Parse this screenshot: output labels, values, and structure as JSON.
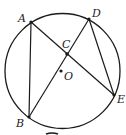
{
  "diagram": {
    "type": "geometry",
    "circle": {
      "center_label": "O",
      "cx": 62.5,
      "cy": 71,
      "r": 57.5
    },
    "points": {
      "A": {
        "label": "A",
        "x": 31,
        "y": 22,
        "on_circle": true
      },
      "B": {
        "label": "B",
        "x": 29,
        "y": 117,
        "on_circle": true
      },
      "C": {
        "label": "C",
        "x": 67,
        "y": 54,
        "on_circle": false
      },
      "D": {
        "label": "D",
        "x": 89,
        "y": 19,
        "on_circle": true
      },
      "E": {
        "label": "E",
        "x": 114,
        "y": 95,
        "on_circle": true
      },
      "O": {
        "label": "O",
        "x": 61,
        "y": 71,
        "on_circle": false
      }
    },
    "segments": [
      "AB",
      "AE",
      "BD",
      "DE"
    ],
    "intersection": "C = AE ∩ BD",
    "colors": {
      "stroke": "#1a1a1a",
      "background": "#ffffff"
    }
  }
}
